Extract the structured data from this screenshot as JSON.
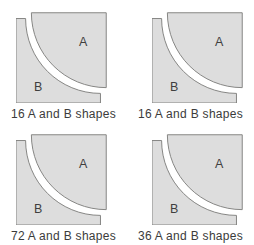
{
  "page": {
    "background": "#ffffff"
  },
  "figures": [
    {
      "position": "top-left",
      "caption": "16 A and B shapes",
      "label_a": "A",
      "label_b": "B",
      "fill_a": "#e8e8e6",
      "fill_b": "#9d9d9b"
    },
    {
      "position": "top-right",
      "caption": "16 A and B shapes",
      "label_a": "A",
      "label_b": "B",
      "fill_a": "#a7a7a5",
      "fill_b": "#e8e8e6"
    },
    {
      "position": "bottom-left",
      "caption": "72 A and B shapes",
      "label_a": "A",
      "label_b": "B",
      "fill_a": "#b0b0ae",
      "fill_b": "#e8e8e6"
    },
    {
      "position": "bottom-right",
      "caption": "36 A and B shapes",
      "label_a": "A",
      "label_b": "B",
      "fill_a": "#b0b0ae",
      "fill_b": "#b0b0ae"
    }
  ],
  "styles": {
    "outline_color": "#82827f",
    "label_color": "#3f3f3f",
    "caption_color": "#3b3b3b"
  }
}
